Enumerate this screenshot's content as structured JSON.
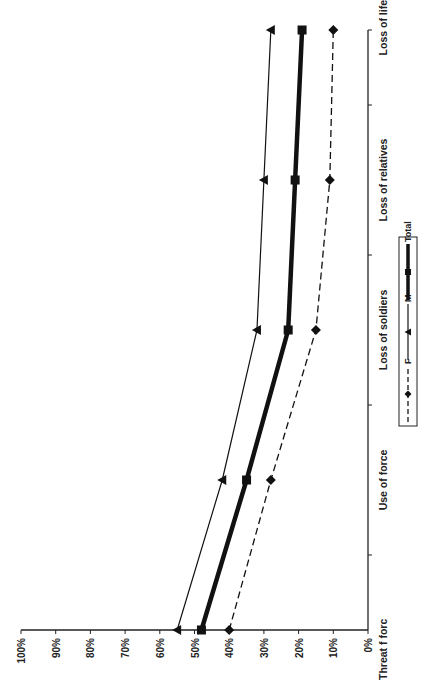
{
  "chart_data": {
    "type": "line",
    "orientation": "rotated-90-ccw",
    "title": "",
    "xlabel": "",
    "ylabel": "",
    "categories": [
      "Threat f forc",
      "Use of force",
      "Loss of soldiers",
      "Loss of relatives",
      "Loss of life"
    ],
    "value_ticks": [
      "0%",
      "10%",
      "20%",
      "30%",
      "40%",
      "50%",
      "60%",
      "70%",
      "80%",
      "90%",
      "100%"
    ],
    "ylim": [
      0,
      100
    ],
    "grid": false,
    "legend_position": "center-right",
    "series": [
      {
        "name": "F",
        "style": "dashed",
        "marker": "diamond",
        "values": [
          40,
          28,
          15,
          11,
          10
        ]
      },
      {
        "name": "M",
        "style": "solid-thin",
        "marker": "triangle",
        "values": [
          55,
          42,
          32,
          30,
          28
        ]
      },
      {
        "name": "Total",
        "style": "solid-thick",
        "marker": "square",
        "values": [
          48,
          35,
          23,
          21,
          19
        ]
      }
    ]
  },
  "colors": {
    "line": "#111111",
    "axis": "#222222",
    "background": "#ffffff"
  }
}
